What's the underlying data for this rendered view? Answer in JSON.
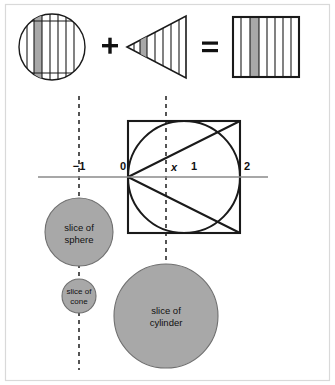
{
  "figure": {
    "colors": {
      "shaded_band": "#a8a8a8",
      "outline": "#1a1a1a",
      "axis": "#8a8a8a",
      "frame": "#d9d9d9",
      "disc_fill": "#a8a8a8",
      "disc_stroke": "#6f6f6f"
    }
  },
  "equation_row": {
    "terms": [
      {
        "name": "sphere",
        "shape": "circle-with-vertical-stripes",
        "stripe_count": 8,
        "shaded_stripe_index": 2
      },
      {
        "name": "cone",
        "shape": "triangle-pointing-left-with-vertical-stripes",
        "stripe_count": 7,
        "shaded_stripe_index": 2
      },
      {
        "name": "cylinder",
        "shape": "square-with-vertical-stripes",
        "stripe_count": 8,
        "shaded_stripe_index": 3
      }
    ],
    "operators": {
      "plus": "+",
      "equals": "="
    }
  },
  "main_diagram": {
    "axis_ticks": [
      {
        "label": "−1",
        "value": -1
      },
      {
        "label": "0",
        "value": 0
      },
      {
        "label": "x",
        "value": 0.55,
        "italic": true
      },
      {
        "label": "1",
        "value": 1
      },
      {
        "label": "2",
        "value": 2
      }
    ],
    "square": {
      "x_from": 0,
      "x_to": 2,
      "description": "square circumscribing the circle"
    },
    "circle": {
      "center_x": 1,
      "center_y": 0,
      "radius": 1,
      "description": "circle inscribed in square"
    },
    "cone_rays": [
      {
        "from": [
          0,
          0
        ],
        "to": [
          2,
          1
        ]
      },
      {
        "from": [
          0,
          0
        ],
        "to": [
          2,
          -1
        ]
      }
    ],
    "dashed_verticals": [
      {
        "at_x": -1,
        "label": "−1"
      },
      {
        "at_x": 0.55,
        "label": "x"
      }
    ]
  },
  "slices": [
    {
      "name": "slice-of-sphere",
      "label_line1": "slice of",
      "label_line2": "sphere",
      "radius": 34
    },
    {
      "name": "slice-of-cone",
      "label_line1": "slice of",
      "label_line2": "cone",
      "radius": 17
    },
    {
      "name": "slice-of-cylinder",
      "label_line1": "slice of",
      "label_line2": "cylinder",
      "radius": 52
    }
  ]
}
